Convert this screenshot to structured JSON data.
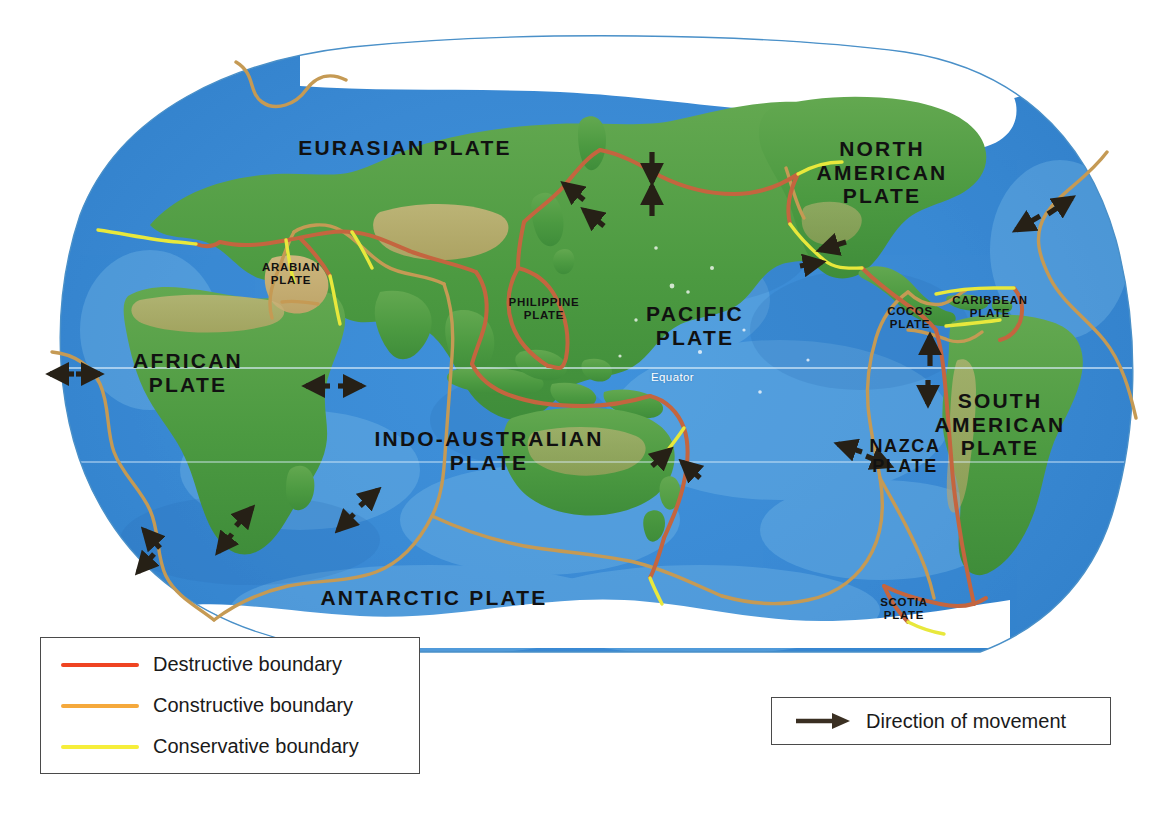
{
  "map": {
    "title": "World map of tectonic plates",
    "projection": "oval pacific-centred world projection",
    "ocean_color": "#3e8fd8",
    "land_color": "#4f9e45",
    "ice_color": "#ffffff",
    "equator_label": "Equator",
    "equator_line_color": "#cfe8f7"
  },
  "plates": [
    {
      "name": "eurasian",
      "label": "EURASIAN PLATE",
      "size": "big",
      "x": 405,
      "y": 148
    },
    {
      "name": "north-american",
      "label": "NORTH\nAMERICAN\nPLATE",
      "size": "big",
      "x": 882,
      "y": 172
    },
    {
      "name": "pacific",
      "label": "PACIFIC\nPLATE",
      "size": "big",
      "x": 695,
      "y": 326
    },
    {
      "name": "african",
      "label": "AFRICAN\nPLATE",
      "size": "big",
      "x": 188,
      "y": 373
    },
    {
      "name": "south-american",
      "label": "SOUTH\nAMERICAN\nPLATE",
      "size": "big",
      "x": 1000,
      "y": 424
    },
    {
      "name": "indo-australian",
      "label": "INDO-AUSTRALIAN\nPLATE",
      "size": "big",
      "x": 489,
      "y": 451
    },
    {
      "name": "nazca",
      "label": "NAZCA\nPLATE",
      "size": "mid",
      "x": 905,
      "y": 456
    },
    {
      "name": "antarctic",
      "label": "ANTARCTIC PLATE",
      "size": "big",
      "x": 434,
      "y": 598
    },
    {
      "name": "arabian",
      "label": "ARABIAN\nPLATE",
      "size": "small",
      "x": 291,
      "y": 274
    },
    {
      "name": "philippine",
      "label": "PHILIPPINE\nPLATE",
      "size": "small",
      "x": 544,
      "y": 309
    },
    {
      "name": "cocos",
      "label": "COCOS\nPLATE",
      "size": "small",
      "x": 910,
      "y": 318
    },
    {
      "name": "caribbean",
      "label": "CARIBBEAN\nPLATE",
      "size": "small",
      "x": 990,
      "y": 307
    },
    {
      "name": "scotia",
      "label": "SCOTIA\nPLATE",
      "size": "small",
      "x": 904,
      "y": 609
    }
  ],
  "equator": {
    "label": "Equator",
    "x": 651,
    "y": 377
  },
  "legend_boundaries": {
    "name": "boundary-legend",
    "items": [
      {
        "key": "destructive",
        "label": "Destructive boundary",
        "color": "#ef4422"
      },
      {
        "key": "constructive",
        "label": "Constructive boundary",
        "color": "#f5a93c"
      },
      {
        "key": "conservative",
        "label": "Conservative boundary",
        "color": "#f6ee3a"
      }
    ]
  },
  "legend_movement": {
    "name": "movement-legend",
    "label": "Direction of movement",
    "arrow_color": "#3a2f22"
  },
  "colors": {
    "destructive": "#c4653f",
    "destructive_legend": "#ef4422",
    "constructive": "#c59a54",
    "conservative": "#e8e83c",
    "arrow": "#262016",
    "text": "#111111",
    "legend_border": "#4a4a4a",
    "map_outline": "#4a90c8"
  }
}
